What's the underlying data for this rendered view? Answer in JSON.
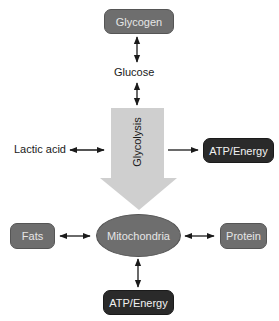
{
  "diagram": {
    "nodes": {
      "glycogen": "Glycogen",
      "glucose": "Glucose",
      "glycolysis": "Glycolysis",
      "lactic_acid": "Lactic acid",
      "atp_energy_right": "ATP/Energy",
      "fats": "Fats",
      "mitochondria": "Mitochondria",
      "protein": "Protein",
      "atp_energy_bottom": "ATP/Energy"
    },
    "edges": [
      {
        "from": "Glycogen",
        "to": "Glucose",
        "type": "bidirectional"
      },
      {
        "from": "Glucose",
        "to": "Glycolysis",
        "type": "bidirectional"
      },
      {
        "from": "Lactic acid",
        "to": "Glycolysis",
        "type": "bidirectional"
      },
      {
        "from": "Glycolysis",
        "to": "ATP/Energy",
        "type": "directed"
      },
      {
        "from": "Glycolysis",
        "to": "Mitochondria",
        "type": "directed"
      },
      {
        "from": "Fats",
        "to": "Mitochondria",
        "type": "bidirectional"
      },
      {
        "from": "Mitochondria",
        "to": "Protein",
        "type": "bidirectional"
      },
      {
        "from": "Mitochondria",
        "to": "ATP/Energy",
        "type": "bidirectional"
      }
    ],
    "colors": {
      "gray_node": "#6e6e6e",
      "dark_node": "#2a2a2a",
      "big_arrow": "#cfcfcf",
      "line": "#1a1a1a"
    }
  }
}
